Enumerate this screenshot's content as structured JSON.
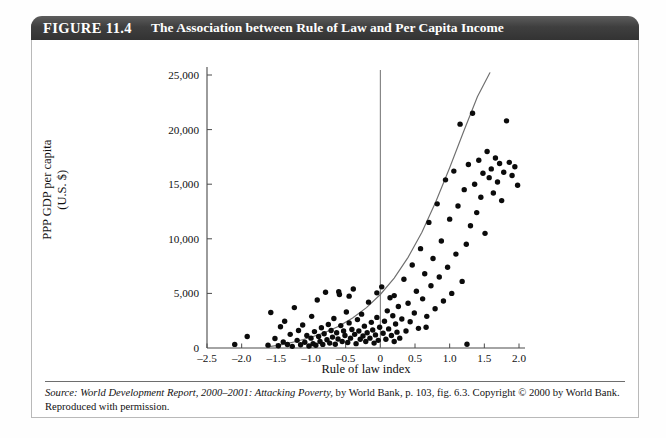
{
  "figure": {
    "number": "FIGURE 11.4",
    "title": "The Association between Rule of Law and Per Capita Income"
  },
  "source": {
    "prefix": "Source:",
    "italic_part": "World Development Report, 2000–2001: Attacking Poverty,",
    "rest": "by World Bank, p. 103, fig. 6.3. Copyright © 2000 by World Bank. Reproduced with permission."
  },
  "chart_data": {
    "type": "scatter",
    "title": "The Association between Rule of Law and Per Capita Income",
    "xlabel": "Rule of law index",
    "ylabel_line1": "PPP GDP per capita",
    "ylabel_line2": "(U.S. $)",
    "xlim": [
      -2.5,
      2.0
    ],
    "ylim": [
      0,
      25000
    ],
    "xticks": [
      -2.5,
      -2.0,
      -1.5,
      -1.0,
      -0.5,
      0,
      0.5,
      1.0,
      1.5,
      2.0
    ],
    "xticklabels": [
      "–2.5",
      "–2.0",
      "–1.5",
      "–1.0",
      "–0.5",
      "0",
      "0.5",
      "1.0",
      "1.5",
      "2.0"
    ],
    "yticks": [
      0,
      5000,
      10000,
      15000,
      20000,
      25000
    ],
    "yticklabels": [
      "0",
      "5,000",
      "10,000",
      "15,000",
      "20,000",
      "25,000"
    ],
    "grid": false,
    "legend": null,
    "marker_color": "#0b0b0b",
    "reference_line": {
      "type": "vertical",
      "x": 0,
      "color": "#6f6f6f"
    },
    "trend_curve": {
      "type": "exponential",
      "color": "#6f6f6f",
      "x_start": -1.62,
      "x_end": 1.58,
      "points": [
        [
          -1.62,
          100
        ],
        [
          -1.4,
          330
        ],
        [
          -1.2,
          620
        ],
        [
          -1.0,
          980
        ],
        [
          -0.8,
          1420
        ],
        [
          -0.6,
          2000
        ],
        [
          -0.4,
          2750
        ],
        [
          -0.2,
          3700
        ],
        [
          0.0,
          4900
        ],
        [
          0.2,
          6400
        ],
        [
          0.4,
          8300
        ],
        [
          0.6,
          10600
        ],
        [
          0.8,
          13400
        ],
        [
          1.0,
          16500
        ],
        [
          1.2,
          19800
        ],
        [
          1.4,
          23000
        ],
        [
          1.58,
          25200
        ]
      ]
    },
    "points": [
      [
        -2.1,
        330
      ],
      [
        -1.92,
        1050
      ],
      [
        -1.62,
        260
      ],
      [
        -1.58,
        3250
      ],
      [
        -1.52,
        870
      ],
      [
        -1.47,
        200
      ],
      [
        -1.44,
        1950
      ],
      [
        -1.4,
        560
      ],
      [
        -1.38,
        2450
      ],
      [
        -1.34,
        320
      ],
      [
        -1.3,
        1250
      ],
      [
        -1.27,
        150
      ],
      [
        -1.24,
        3700
      ],
      [
        -1.2,
        700
      ],
      [
        -1.18,
        1600
      ],
      [
        -1.15,
        300
      ],
      [
        -1.12,
        2100
      ],
      [
        -1.09,
        520
      ],
      [
        -1.06,
        1150
      ],
      [
        -1.03,
        180
      ],
      [
        -1.0,
        900
      ],
      [
        -0.99,
        2900
      ],
      [
        -0.97,
        400
      ],
      [
        -0.95,
        1500
      ],
      [
        -0.93,
        250
      ],
      [
        -0.91,
        4400
      ],
      [
        -0.89,
        1050
      ],
      [
        -0.87,
        600
      ],
      [
        -0.85,
        1850
      ],
      [
        -0.83,
        330
      ],
      [
        -0.81,
        1300
      ],
      [
        -0.79,
        5100
      ],
      [
        -0.77,
        760
      ],
      [
        -0.75,
        2150
      ],
      [
        -0.73,
        450
      ],
      [
        -0.71,
        1600
      ],
      [
        -0.69,
        1000
      ],
      [
        -0.67,
        2700
      ],
      [
        -0.65,
        350
      ],
      [
        -0.63,
        1400
      ],
      [
        -0.61,
        820
      ],
      [
        -0.59,
        4900
      ],
      [
        -0.57,
        2050
      ],
      [
        -0.55,
        600
      ],
      [
        -0.53,
        1550
      ],
      [
        -0.51,
        1150
      ],
      [
        -0.49,
        3300
      ],
      [
        -0.47,
        500
      ],
      [
        -0.45,
        2300
      ],
      [
        -0.43,
        900
      ],
      [
        -0.41,
        1700
      ],
      [
        -0.39,
        5400
      ],
      [
        -0.37,
        1250
      ],
      [
        -0.35,
        400
      ],
      [
        -0.33,
        2600
      ],
      [
        -0.31,
        1550
      ],
      [
        -0.29,
        800
      ],
      [
        -0.27,
        3100
      ],
      [
        -0.25,
        1100
      ],
      [
        -0.23,
        2000
      ],
      [
        -0.21,
        600
      ],
      [
        -0.19,
        1400
      ],
      [
        -0.17,
        4200
      ],
      [
        -0.15,
        900
      ],
      [
        -0.13,
        2350
      ],
      [
        -0.11,
        1650
      ],
      [
        -0.09,
        450
      ],
      [
        -0.07,
        1200
      ],
      [
        -0.05,
        2800
      ],
      [
        -0.03,
        700
      ],
      [
        -0.01,
        1900
      ],
      [
        0.02,
        5600
      ],
      [
        0.04,
        1350
      ],
      [
        0.06,
        2450
      ],
      [
        0.08,
        800
      ],
      [
        0.1,
        3400
      ],
      [
        0.12,
        1750
      ],
      [
        0.14,
        4600
      ],
      [
        0.16,
        1150
      ],
      [
        0.18,
        2950
      ],
      [
        0.2,
        600
      ],
      [
        0.22,
        2200
      ],
      [
        0.24,
        1450
      ],
      [
        0.26,
        3800
      ],
      [
        0.28,
        900
      ],
      [
        0.31,
        2650
      ],
      [
        0.34,
        6300
      ],
      [
        0.37,
        1550
      ],
      [
        0.4,
        4100
      ],
      [
        0.43,
        2400
      ],
      [
        0.46,
        7600
      ],
      [
        0.49,
        3200
      ],
      [
        0.52,
        5200
      ],
      [
        0.55,
        1800
      ],
      [
        0.58,
        9100
      ],
      [
        0.61,
        4500
      ],
      [
        0.64,
        6800
      ],
      [
        0.67,
        2900
      ],
      [
        0.7,
        11500
      ],
      [
        0.73,
        5700
      ],
      [
        0.76,
        8200
      ],
      [
        0.79,
        3600
      ],
      [
        0.82,
        13200
      ],
      [
        0.85,
        6500
      ],
      [
        0.88,
        9800
      ],
      [
        0.91,
        4300
      ],
      [
        0.94,
        15400
      ],
      [
        0.97,
        7400
      ],
      [
        1.0,
        11800
      ],
      [
        1.03,
        5000
      ],
      [
        1.06,
        16200
      ],
      [
        1.09,
        8600
      ],
      [
        1.12,
        13000
      ],
      [
        1.15,
        20500
      ],
      [
        1.18,
        6100
      ],
      [
        1.21,
        14500
      ],
      [
        1.24,
        9500
      ],
      [
        1.27,
        16800
      ],
      [
        1.3,
        11200
      ],
      [
        1.33,
        21500
      ],
      [
        1.36,
        15000
      ],
      [
        1.39,
        12400
      ],
      [
        1.42,
        17200
      ],
      [
        1.45,
        13800
      ],
      [
        1.48,
        16000
      ],
      [
        1.51,
        10500
      ],
      [
        1.54,
        18000
      ],
      [
        1.57,
        15600
      ],
      [
        1.6,
        16400
      ],
      [
        1.63,
        14200
      ],
      [
        1.66,
        17400
      ],
      [
        1.69,
        15200
      ],
      [
        1.72,
        16900
      ],
      [
        1.75,
        13500
      ],
      [
        1.78,
        16100
      ],
      [
        1.82,
        20800
      ],
      [
        1.86,
        17000
      ],
      [
        1.9,
        15800
      ],
      [
        1.94,
        16600
      ],
      [
        1.98,
        14900
      ],
      [
        1.25,
        350
      ],
      [
        -0.6,
        5150
      ],
      [
        -0.45,
        4750
      ],
      [
        0.66,
        1900
      ],
      [
        0.2,
        4800
      ],
      [
        -0.05,
        5050
      ]
    ]
  }
}
